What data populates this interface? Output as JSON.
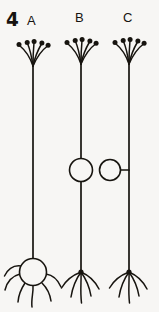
{
  "figure": {
    "number_label": "4",
    "caption_visible": false,
    "background_color": "#f7f6f4",
    "ink_color": "#17140f",
    "width_px": 159,
    "height_px": 312
  },
  "panels": [
    {
      "id": "A",
      "label": "A",
      "label_x": 27,
      "label_y": 14,
      "axon_x": 33,
      "axon_top_y": 66,
      "axon_bottom_y": 258,
      "apical_tuft": {
        "branch_count": 5,
        "origin_x": 33,
        "origin_y": 66,
        "spread_px": 25,
        "terminal_bulbs": true
      },
      "soma": {
        "present": true,
        "shape": "circle",
        "position": "basal",
        "center_x": 33,
        "center_y": 272,
        "radius": 14,
        "attached": "inline"
      },
      "basal_dendrites": {
        "branch_count": 6,
        "style": "radiating-curved",
        "origin_y": 272
      }
    },
    {
      "id": "B",
      "label": "B",
      "label_x": 75,
      "label_y": 11,
      "axon_x": 81,
      "axon_top_y": 64,
      "axon_bottom_y": 272,
      "apical_tuft": {
        "branch_count": 5,
        "origin_x": 81,
        "origin_y": 64,
        "spread_px": 25,
        "terminal_bulbs": true
      },
      "soma": {
        "present": true,
        "shape": "circle",
        "position": "mid-axon",
        "center_x": 81,
        "center_y": 170,
        "radius": 12,
        "attached": "inline"
      },
      "basal_dendrites": {
        "branch_count": 5,
        "style": "root-splay",
        "origin_y": 272
      }
    },
    {
      "id": "C",
      "label": "C",
      "label_x": 123,
      "label_y": 11,
      "axon_x": 129,
      "axon_top_y": 64,
      "axon_bottom_y": 272,
      "apical_tuft": {
        "branch_count": 5,
        "origin_x": 129,
        "origin_y": 64,
        "spread_px": 25,
        "terminal_bulbs": true
      },
      "soma": {
        "present": true,
        "shape": "circle",
        "position": "offset-left-stalked",
        "center_x": 110,
        "center_y": 170,
        "radius": 11,
        "attached": "stalk",
        "stalk_from_x": 121,
        "stalk_to_x": 129
      },
      "basal_dendrites": {
        "branch_count": 5,
        "style": "root-splay",
        "origin_y": 272
      }
    }
  ]
}
